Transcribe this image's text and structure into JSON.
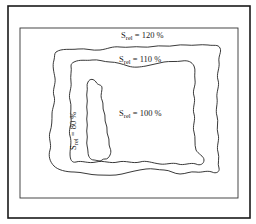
{
  "figure": {
    "type": "contour-map",
    "colors": {
      "line": "#222222",
      "background": "#ffffff"
    },
    "contours": [
      {
        "id": "contour-120",
        "symbol": "S",
        "subscript": "rel",
        "value_text": " = 120 %",
        "value": 120
      },
      {
        "id": "contour-110",
        "symbol": "S",
        "subscript": "rel",
        "value_text": " = 110 %",
        "value": 110
      },
      {
        "id": "contour-100",
        "symbol": "S",
        "subscript": "rel",
        "value_text": " = 100 %",
        "value": 100
      },
      {
        "id": "contour-80",
        "symbol": "S",
        "subscript": "rel",
        "value_text": " = 80 %",
        "value": 80
      }
    ]
  }
}
